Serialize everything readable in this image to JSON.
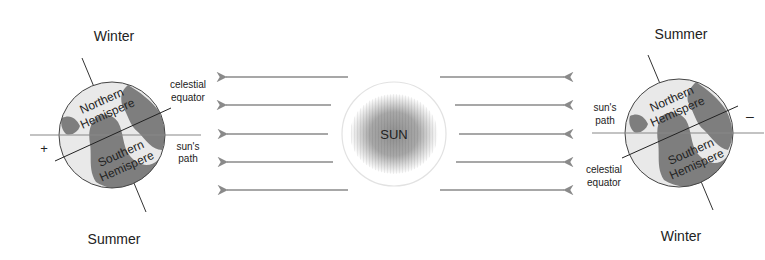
{
  "colors": {
    "arrow": "#8a8a8a",
    "line": "#333333",
    "ocean": "#7a7a7a",
    "land": "#e8e8e8",
    "sun_core": "#9a9a9a",
    "sun_ring": "#dddddd"
  },
  "sun": {
    "label": "SUN"
  },
  "left_earth": {
    "top_label": "Winter",
    "bottom_label": "Summer",
    "north_line1": "Northern",
    "north_line2": "Hemispere",
    "south_line1": "Southern",
    "south_line2": "Hemispere",
    "equator_line1": "celestial",
    "equator_line2": "equator",
    "path_line1": "sun's",
    "path_line2": "path",
    "sign": "+"
  },
  "right_earth": {
    "top_label": "Summer",
    "bottom_label": "Winter",
    "north_line1": "Northern",
    "north_line2": "Hemispere",
    "south_line1": "Southern",
    "south_line2": "Hemispere",
    "equator_line1": "celestial",
    "equator_line2": "equator",
    "path_line1": "sun's",
    "path_line2": "path",
    "sign": "–"
  },
  "rays": {
    "left": [
      {
        "y": 77,
        "x1": 348,
        "x2": 224
      },
      {
        "y": 105,
        "x1": 331,
        "x2": 224
      },
      {
        "y": 134,
        "x1": 328,
        "x2": 225
      },
      {
        "y": 162,
        "x1": 333,
        "x2": 225
      },
      {
        "y": 190,
        "x1": 348,
        "x2": 225
      }
    ],
    "right": [
      {
        "y": 77,
        "x1": 440,
        "x2": 566
      },
      {
        "y": 105,
        "x1": 455,
        "x2": 566
      },
      {
        "y": 134,
        "x1": 459,
        "x2": 566
      },
      {
        "y": 162,
        "x1": 456,
        "x2": 566
      },
      {
        "y": 190,
        "x1": 440,
        "x2": 566
      }
    ]
  }
}
